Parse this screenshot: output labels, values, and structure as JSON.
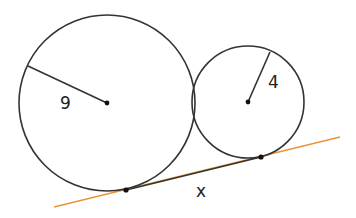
{
  "diagram": {
    "partial_label": ")",
    "large_circle": {
      "radius_label": "9",
      "cx": 107,
      "cy": 103,
      "r": 89
    },
    "small_circle": {
      "radius_label": "4",
      "cx": 248,
      "cy": 102,
      "r": 56
    },
    "tangent_segment_label": "x",
    "colors": {
      "stroke": "#333333",
      "tangent_line": "#e8953a"
    }
  }
}
